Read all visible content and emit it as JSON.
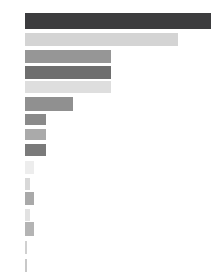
{
  "chart_data": {
    "type": "bar",
    "orientation": "horizontal",
    "title": "",
    "subtitle": "",
    "xlabel": "",
    "ylabel": "",
    "grid": false,
    "legend": false,
    "axis_visible": false,
    "tick_labels_visible": false,
    "categories": [
      "",
      "",
      "",
      "",
      "",
      "",
      "",
      "",
      "",
      "",
      "",
      "",
      "",
      "",
      "",
      ""
    ],
    "values": [
      186,
      153,
      86,
      86,
      86,
      48,
      21,
      21,
      21,
      9,
      5,
      9,
      5,
      9,
      2,
      2
    ],
    "xlim": [
      0,
      197
    ],
    "bar_colors": [
      "#3c3c3e",
      "#d4d4d4",
      "#969696",
      "#6e6e6e",
      "#dedede",
      "#909090",
      "#8a8a8a",
      "#aaaaaa",
      "#7a7a7a",
      "#ededed",
      "#d8d8d8",
      "#a9a9a9",
      "#e2e2e2",
      "#b4b4b4",
      "#d0d0d0",
      "#c8c8c8"
    ],
    "bar_geometry": [
      {
        "y": 13,
        "height": 16,
        "width": 186
      },
      {
        "y": 33,
        "height": 13,
        "width": 153
      },
      {
        "y": 50,
        "height": 13,
        "width": 86
      },
      {
        "y": 66,
        "height": 13,
        "width": 86
      },
      {
        "y": 81,
        "height": 12,
        "width": 86
      },
      {
        "y": 97,
        "height": 14,
        "width": 48
      },
      {
        "y": 114,
        "height": 11,
        "width": 21
      },
      {
        "y": 129,
        "height": 11,
        "width": 21
      },
      {
        "y": 144,
        "height": 12,
        "width": 21
      },
      {
        "y": 161,
        "height": 13,
        "width": 9
      },
      {
        "y": 178,
        "height": 12,
        "width": 5
      },
      {
        "y": 192,
        "height": 13,
        "width": 9
      },
      {
        "y": 209,
        "height": 12,
        "width": 5
      },
      {
        "y": 222,
        "height": 14,
        "width": 9
      },
      {
        "y": 241,
        "height": 13,
        "width": 2
      },
      {
        "y": 259,
        "height": 13,
        "width": 2
      }
    ],
    "background_color": "#ffffff",
    "plot_origin_x": 25
  }
}
